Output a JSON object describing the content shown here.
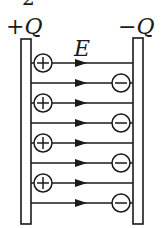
{
  "labels": {
    "top_fragment": "2",
    "left_charge_sign": "+",
    "left_charge_symbol": "Q",
    "right_charge_sign": "−",
    "right_charge_symbol": "Q",
    "field_symbol": "E"
  },
  "colors": {
    "ink": "#1a1a1a",
    "background": "#ffffff"
  },
  "plates": [
    {
      "name": "positive-plate",
      "charge": "+Q"
    },
    {
      "name": "negative-plate",
      "charge": "-Q"
    }
  ],
  "field_lines": [
    {
      "y": 63,
      "charge_left": "+",
      "charge_right": null
    },
    {
      "y": 83,
      "charge_left": null,
      "charge_right": "-"
    },
    {
      "y": 103,
      "charge_left": "+",
      "charge_right": null
    },
    {
      "y": 123,
      "charge_left": null,
      "charge_right": "-"
    },
    {
      "y": 143,
      "charge_left": "+",
      "charge_right": null
    },
    {
      "y": 163,
      "charge_left": null,
      "charge_right": "-"
    },
    {
      "y": 183,
      "charge_left": "+",
      "charge_right": null
    },
    {
      "y": 203,
      "charge_left": null,
      "charge_right": "-"
    }
  ]
}
